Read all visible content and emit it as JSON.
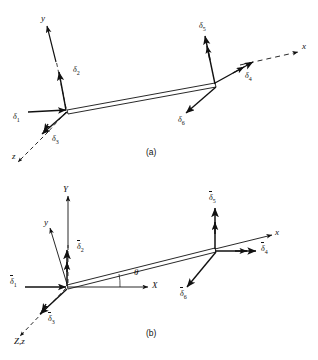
{
  "figure": {
    "background_color": "#ffffff",
    "line_color": "#111111",
    "captions": {
      "a": "(a)",
      "b": "(b)"
    }
  },
  "panel_a": {
    "caption": "(a)",
    "description": "Beam element with local coordinate system and local degrees of freedom",
    "axes": [
      {
        "name": "y-axis",
        "label": "y",
        "origin": "left-node",
        "direction": "up-left",
        "dashed_tail": true
      },
      {
        "name": "x-axis",
        "label": "x",
        "origin": "right-node",
        "direction": "right-up",
        "dashed_tail": true
      },
      {
        "name": "z-axis",
        "label": "z",
        "origin": "left-node",
        "direction": "down-left",
        "dashed_tail": true
      }
    ],
    "dofs": [
      {
        "name": "delta-1",
        "label": "δ",
        "index": "1",
        "arrowheads": 1,
        "node": "left",
        "direction": "along-x",
        "type": "translation"
      },
      {
        "name": "delta-2",
        "label": "δ",
        "index": "2",
        "arrowheads": 1,
        "node": "left",
        "direction": "along-y",
        "type": "translation"
      },
      {
        "name": "delta-3",
        "label": "δ",
        "index": "3",
        "arrowheads": 2,
        "node": "left",
        "direction": "along-z",
        "type": "rotation"
      },
      {
        "name": "delta-4",
        "label": "δ",
        "index": "4",
        "arrowheads": 2,
        "node": "right",
        "direction": "along-x",
        "type": "translation"
      },
      {
        "name": "delta-5",
        "label": "δ",
        "index": "5",
        "arrowheads": 2,
        "node": "right",
        "direction": "along-y",
        "type": "translation"
      },
      {
        "name": "delta-6",
        "label": "δ",
        "index": "6",
        "arrowheads": 1,
        "node": "right",
        "direction": "along-z",
        "type": "rotation"
      }
    ]
  },
  "panel_b": {
    "caption": "(b)",
    "description": "Beam element with global coordinate system, local axes and inclination angle theta",
    "angle": {
      "name": "theta",
      "symbol": "θ",
      "between": "X-axis and beam local x-axis"
    },
    "axes": [
      {
        "name": "global-Y-axis",
        "label": "Y",
        "origin": "left-node",
        "direction": "up",
        "dashed_tail": true
      },
      {
        "name": "global-X-axis",
        "label": "X",
        "origin": "left-node",
        "direction": "right",
        "dashed_tail": false
      },
      {
        "name": "global-Z-local-z-axis",
        "label": "Z,z",
        "origin": "left-node",
        "direction": "down-left",
        "dashed_tail": true
      },
      {
        "name": "local-y-axis",
        "label": "y",
        "origin": "left-node",
        "direction": "up-left",
        "dashed_tail": false
      },
      {
        "name": "local-x-axis",
        "label": "x",
        "origin": "right-node",
        "direction": "right-up",
        "dashed_tail": false
      }
    ],
    "dofs": [
      {
        "name": "delta-bar-1",
        "label": "δ",
        "index": "1",
        "overbar": true,
        "arrowheads": 1,
        "node": "left",
        "direction": "along-global-X",
        "type": "translation"
      },
      {
        "name": "delta-bar-2",
        "label": "δ",
        "index": "2",
        "overbar": true,
        "arrowheads": 1,
        "node": "left",
        "direction": "along-global-Y",
        "type": "translation"
      },
      {
        "name": "delta-bar-3",
        "label": "δ",
        "index": "3",
        "overbar": true,
        "arrowheads": 2,
        "node": "left",
        "direction": "along-global-Z",
        "type": "rotation"
      },
      {
        "name": "delta-bar-4",
        "label": "δ",
        "index": "4",
        "overbar": true,
        "arrowheads": 2,
        "node": "right",
        "direction": "along-global-X",
        "type": "translation"
      },
      {
        "name": "delta-bar-5",
        "label": "δ",
        "index": "5",
        "overbar": true,
        "arrowheads": 2,
        "node": "right",
        "direction": "along-global-Y",
        "type": "translation"
      },
      {
        "name": "delta-bar-6",
        "label": "δ",
        "index": "6",
        "overbar": true,
        "arrowheads": 1,
        "node": "right",
        "direction": "along-global-Z",
        "type": "rotation"
      }
    ]
  }
}
